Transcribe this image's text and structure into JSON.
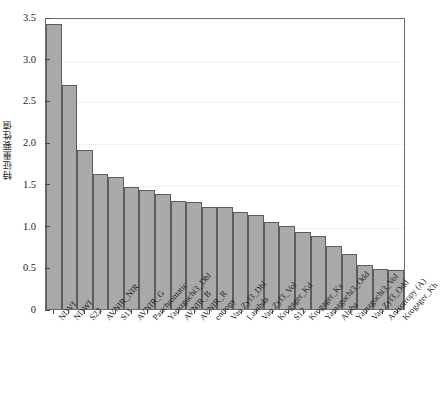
{
  "chart_data": {
    "type": "bar",
    "title": "",
    "subtitle": "",
    "xlabel": "",
    "ylabel": "特征重要性值",
    "ylim": [
      0,
      3.5
    ],
    "ytick_labels": [
      "0",
      "0.5",
      "1.0",
      "1.5",
      "2.0",
      "2.5",
      "3.0",
      "3.5"
    ],
    "ytick_values": [
      0,
      0.5,
      1.0,
      1.5,
      2.0,
      2.5,
      3.0,
      3.5
    ],
    "grid": "horizontal-dotted",
    "legend": "none",
    "bar_color": "#a9a9a9",
    "bar_edge_color": "#5d5d5d",
    "grid_color": "#e4e4e4",
    "axis_color": "#6b6b6b",
    "categories": [
      "NDVI",
      "NDWI",
      "S22",
      "AVNIR_NIR",
      "S11",
      "AVNIR_G",
      "Panchromatic",
      "Yamaguchi3_Dbl",
      "AVNIR_B",
      "AVNIR_R",
      "entropy",
      "Van Zyl3_Dbl",
      "Lambda",
      "Van Zyl3_Vol",
      "Krogager_Kd",
      "S12",
      "Krogager_Ks",
      "Yamaguchi3_Odd",
      "Alpha",
      "Yamaguchi3_Vol",
      "Van Zyl3_Odd",
      "Anisotropy (A)",
      "Krogager_Kh"
    ],
    "values": [
      3.42,
      2.68,
      1.91,
      1.62,
      1.58,
      1.46,
      1.43,
      1.38,
      1.3,
      1.28,
      1.22,
      1.22,
      1.16,
      1.13,
      1.04,
      1.0,
      0.92,
      0.87,
      0.76,
      0.66,
      0.53,
      0.48,
      0.47
    ]
  }
}
